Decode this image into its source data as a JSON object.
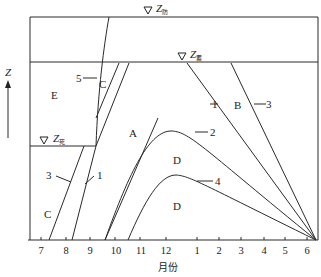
{
  "diagram": {
    "type": "reservoir-dispatch-graph",
    "y_axis_label": "Z",
    "x_axis_label": "月份",
    "x_ticks": [
      "7",
      "8",
      "9",
      "10",
      "11",
      "12",
      "1",
      "2",
      "3",
      "4",
      "5",
      "6"
    ],
    "water_levels": [
      {
        "symbol": "Z",
        "subscript": "防"
      },
      {
        "symbol": "Z",
        "subscript": "蓄"
      },
      {
        "symbol": "Z",
        "subscript": "死"
      }
    ],
    "zones": {
      "A": "A",
      "B": "B",
      "C_upper": "C",
      "C_lower": "C",
      "D_upper": "D",
      "D_lower": "D",
      "E": "E"
    },
    "curve_labels": {
      "c1_upper": "1",
      "c1_lower": "1",
      "c2": "2",
      "c3_upper": "3",
      "c3_lower": "3",
      "c4": "4",
      "c5": "5"
    },
    "colors": {
      "line": "#2a2a2a",
      "background": "#ffffff"
    }
  }
}
